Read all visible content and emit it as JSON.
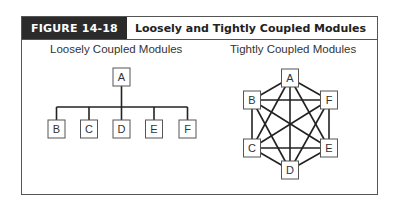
{
  "figure": {
    "number_label": "FIGURE 14-18",
    "title": "Loosely and Tightly Coupled Modules"
  },
  "loose": {
    "subtitle": "Loosely Coupled Modules",
    "root": "A",
    "children": [
      "B",
      "C",
      "D",
      "E",
      "F"
    ]
  },
  "tight": {
    "subtitle": "Tightly Coupled Modules",
    "nodes": [
      "A",
      "B",
      "C",
      "D",
      "E",
      "F"
    ],
    "edges": "complete graph (every module connected to every other)"
  }
}
